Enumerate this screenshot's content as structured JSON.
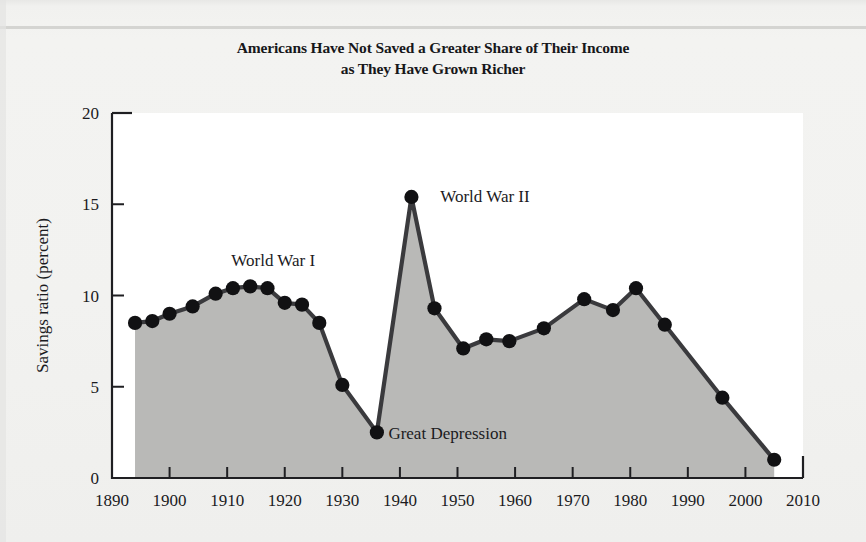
{
  "figure": {
    "kind": "scanned-textbook-figure",
    "background_color": "#f2f2f0",
    "plot_background_color": "#ffffff"
  },
  "title": {
    "line1": "Americans Have Not Saved a Greater Share of Their Income",
    "line2": "as They Have Grown Richer"
  },
  "chart_data": {
    "type": "area",
    "title": "Americans Have Not Saved a Greater Share of Their Income as They Have Grown Richer",
    "subtitle": "",
    "xlabel": "",
    "ylabel": "Savings ratio (percent)",
    "xlim": [
      1890,
      2010
    ],
    "ylim": [
      0,
      20
    ],
    "grid": false,
    "legend": "none",
    "markers": "filled-circle",
    "xticks": [
      1890,
      1900,
      1910,
      1920,
      1930,
      1940,
      1950,
      1960,
      1970,
      1980,
      1990,
      2000,
      2010
    ],
    "xtick_labels": [
      "1890",
      "1900",
      "1910",
      "1920",
      "1930",
      "1940",
      "1950",
      "1960",
      "1970",
      "1980",
      "1990",
      "2000",
      "2010"
    ],
    "yticks": [
      0,
      5,
      10,
      15,
      20
    ],
    "ytick_labels": [
      "0",
      "5",
      "10",
      "15",
      "20"
    ],
    "series": [
      {
        "name": "Savings ratio",
        "line_color": "#3a3a3d",
        "fill_color": "#b9b9b7",
        "marker_color": "#111113",
        "x": [
          1894,
          1897,
          1900,
          1904,
          1908,
          1911,
          1914,
          1917,
          1920,
          1923,
          1926,
          1930,
          1936,
          1942,
          1946,
          1951,
          1955,
          1959,
          1965,
          1972,
          1977,
          1981,
          1986,
          1996,
          2005
        ],
        "y": [
          8.5,
          8.6,
          9.0,
          9.4,
          10.1,
          10.4,
          10.5,
          10.4,
          9.6,
          9.5,
          8.5,
          5.1,
          2.5,
          15.4,
          9.3,
          7.1,
          7.6,
          7.5,
          8.2,
          9.8,
          9.2,
          10.4,
          8.4,
          4.4,
          1.0
        ]
      }
    ],
    "annotations": [
      {
        "text": "World War I",
        "x": 1918,
        "y": 11.9,
        "anchor": "middle"
      },
      {
        "text": "World War II",
        "x": 1947,
        "y": 15.4,
        "anchor": "start"
      },
      {
        "text": "Great Depression",
        "x": 1938,
        "y": 2.4,
        "anchor": "start"
      }
    ]
  },
  "axes": {
    "y_axis_title": "Savings ratio (percent)"
  }
}
